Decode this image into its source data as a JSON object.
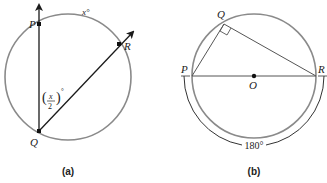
{
  "figure_a": {
    "caption": "(a)",
    "points": {
      "P": "P",
      "Q": "Q",
      "R": "R"
    },
    "arc_label": "x°",
    "angle_label": {
      "numerator": "x",
      "denominator": "2",
      "degree": "°"
    }
  },
  "figure_b": {
    "caption": "(b)",
    "points": {
      "P": "P",
      "Q": "Q",
      "R": "R",
      "O": "O"
    },
    "arc_label": "180°"
  },
  "colors": {
    "circle": "#8a8a8a",
    "line": "#1a1a1a",
    "arc": "#333333"
  }
}
